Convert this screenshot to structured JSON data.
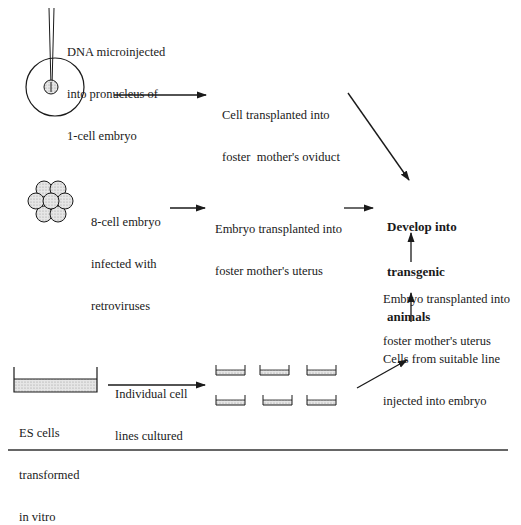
{
  "diagram": {
    "colors": {
      "stroke": "#1a1a1a",
      "fill_stipple": "#d4d4d4",
      "background": "#ffffff"
    },
    "methods": {
      "microinjection": {
        "label_lines": [
          "DNA microinjected",
          "into pronucleus of",
          "1-cell embryo"
        ],
        "step_lines": [
          "Cell transplanted into",
          "foster  mother's oviduct"
        ]
      },
      "retrovirus": {
        "label_lines": [
          "8-cell embryo",
          "infected with",
          "retroviruses"
        ],
        "step_lines": [
          "Embryo transplanted into",
          "foster mother's uterus"
        ]
      },
      "es_cells": {
        "label_lines": [
          "ES cells",
          "transformed",
          "in vitro"
        ],
        "arrow_label_lines": [
          "Individual cell",
          "lines cultured"
        ],
        "step1_lines": [
          "Cells from suitable line",
          "injected into embryo"
        ],
        "step2_lines": [
          "Embryo transplanted into",
          "foster mother's uterus"
        ]
      }
    },
    "outcome": {
      "lines": [
        "Develop into",
        "transgenic",
        "animals"
      ]
    },
    "icons": {
      "micropipette": "micropipette-icon",
      "one_cell_embryo": "one-cell-embryo-icon",
      "eight_cell_embryo": "eight-cell-embryo-icon",
      "culture_dish": "culture-dish-icon",
      "small_dishes_count": 6
    }
  }
}
